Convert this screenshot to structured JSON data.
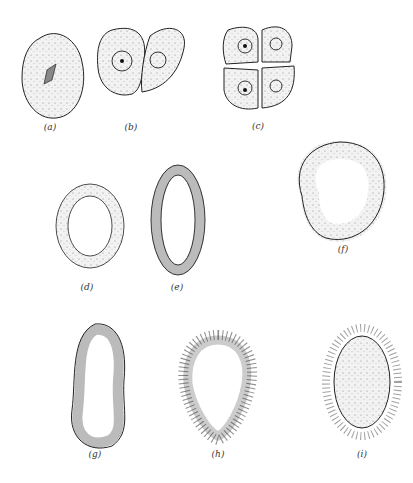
{
  "figure": {
    "panels": [
      {
        "id": "a",
        "label": "(a)",
        "description": "single cell (zygote) with mitotic spindle",
        "label_pos": [
          50,
          128
        ]
      },
      {
        "id": "b",
        "label": "(b)",
        "description": "two-cell stage",
        "label_pos": [
          131,
          128
        ]
      },
      {
        "id": "c",
        "label": "(c)",
        "description": "four-cell stage",
        "label_pos": [
          258,
          127
        ]
      },
      {
        "id": "d",
        "label": "(d)",
        "description": "hollow blastula, ring of cells",
        "label_pos": [
          87,
          288
        ]
      },
      {
        "id": "e",
        "label": "(e)",
        "description": "elongated blastula",
        "label_pos": [
          177,
          288
        ]
      },
      {
        "id": "f",
        "label": "(f)",
        "description": "partial ring of large cells",
        "label_pos": [
          343,
          250
        ]
      },
      {
        "id": "g",
        "label": "(g)",
        "description": "irregular elongated hollow ball",
        "label_pos": [
          95,
          455
        ]
      },
      {
        "id": "h",
        "label": "(h)",
        "description": "ciliated hollow larva",
        "label_pos": [
          218,
          455
        ]
      },
      {
        "id": "i",
        "label": "(i)",
        "description": "ciliated solid larva",
        "label_pos": [
          362,
          455
        ]
      }
    ]
  }
}
